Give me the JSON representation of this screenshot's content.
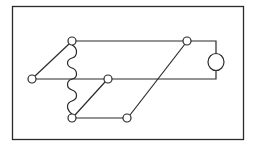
{
  "diagram": {
    "colors": {
      "stroke": "#2a2a2a",
      "background": "#ffffff"
    },
    "frame": {
      "x": 12,
      "y": 6,
      "w": 232,
      "h": 134
    },
    "nodes": [
      {
        "id": "left",
        "x": 32,
        "y": 79
      },
      {
        "id": "top-left",
        "x": 72,
        "y": 41
      },
      {
        "id": "bottom-left",
        "x": 72,
        "y": 118
      },
      {
        "id": "middle",
        "x": 108,
        "y": 79
      },
      {
        "id": "bottom-middle",
        "x": 127,
        "y": 118
      },
      {
        "id": "top-right",
        "x": 187,
        "y": 41
      }
    ],
    "component": {
      "type": "circle",
      "x": 216,
      "y": 62,
      "r": 8
    }
  }
}
